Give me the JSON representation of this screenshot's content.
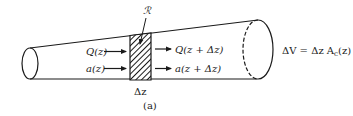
{
  "figure": {
    "panel_label": "(a)",
    "region_label": "ℛ",
    "slice_width_label": "Δz",
    "inflow": {
      "flow_label": "Q(z)",
      "area_label": "a(z)"
    },
    "outflow": {
      "flow_label": "Q(z + Δz)",
      "area_label": "a(z + Δz)"
    },
    "volume_equation": {
      "lhs": "ΔV = Δz A",
      "subscript": "c",
      "rhs": "(z)"
    }
  },
  "colors": {
    "stroke": "#1a1a1a",
    "background": "#ffffff"
  }
}
